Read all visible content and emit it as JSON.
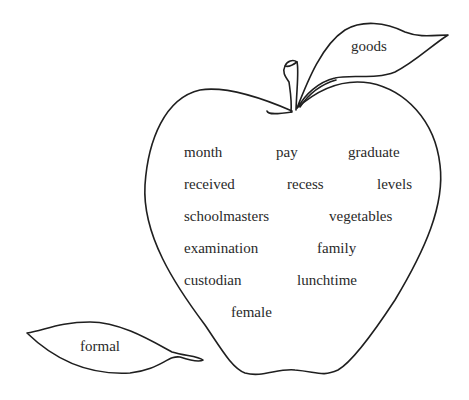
{
  "leaf_top": {
    "word": "goods"
  },
  "leaf_bottom": {
    "word": "formal"
  },
  "apple": {
    "words": [
      {
        "text": "month",
        "x": 184,
        "y": 145
      },
      {
        "text": "pay",
        "x": 276,
        "y": 145
      },
      {
        "text": "graduate",
        "x": 348,
        "y": 145
      },
      {
        "text": "received",
        "x": 184,
        "y": 177
      },
      {
        "text": "recess",
        "x": 287,
        "y": 177
      },
      {
        "text": "levels",
        "x": 377,
        "y": 177
      },
      {
        "text": "schoolmasters",
        "x": 184,
        "y": 209
      },
      {
        "text": "vegetables",
        "x": 329,
        "y": 209
      },
      {
        "text": "examination",
        "x": 184,
        "y": 241
      },
      {
        "text": "family",
        "x": 317,
        "y": 241
      },
      {
        "text": "custodian",
        "x": 184,
        "y": 273
      },
      {
        "text": "lunchtime",
        "x": 297,
        "y": 273
      },
      {
        "text": "female",
        "x": 231,
        "y": 305
      }
    ]
  },
  "colors": {
    "stroke": "#1f1f1f",
    "text": "#2a2a2a",
    "background": "#ffffff"
  }
}
